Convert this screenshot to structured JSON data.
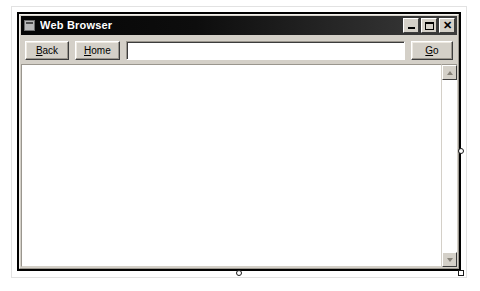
{
  "window": {
    "title": "Web Browser",
    "icon": "window-document-icon",
    "controls": [
      {
        "name": "minimize",
        "glyph": "–",
        "tooltip": "Minimize"
      },
      {
        "name": "maximize",
        "glyph": "□",
        "tooltip": "Maximize"
      },
      {
        "name": "close",
        "glyph": "✕",
        "tooltip": "Close"
      }
    ]
  },
  "toolbar": {
    "back": {
      "label": "Back",
      "mnemonic": "B",
      "before": "",
      "after": "ack"
    },
    "home": {
      "label": "Home",
      "mnemonic": "H",
      "before": "",
      "after": "ome"
    },
    "go": {
      "label": "Go",
      "mnemonic": "G",
      "before": "",
      "after": "o"
    },
    "address": {
      "value": "",
      "placeholder": ""
    }
  },
  "content": {
    "page_text": "",
    "scrollbar": {
      "up_icon": "scroll-up-arrow-icon",
      "down_icon": "scroll-down-arrow-icon",
      "position": "top"
    }
  },
  "designer": {
    "selected": true,
    "handles": [
      "right-middle",
      "bottom-center",
      "bottom-right"
    ]
  },
  "colors": {
    "face": "#d4d0c8",
    "titlebar_dark": "#050505",
    "titlebar_light": "#3c3c3c",
    "title_text": "#ffffff",
    "page_background": "#ffffff",
    "frame": "#000000"
  }
}
